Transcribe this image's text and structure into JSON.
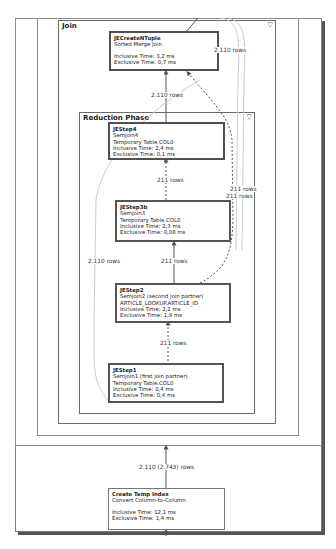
{
  "diagram": {
    "type": "query execution plan",
    "groups": {
      "join": {
        "title": "Join",
        "collapse_icon": "▽"
      },
      "reduction": {
        "title": "Reduction Phase",
        "collapse_icon": "▽"
      }
    },
    "nodes": {
      "create_ntuple": {
        "name": "JECreateNTuple",
        "op": "Sorted Merge Join",
        "inclusive": "Inclusive Time: 3,2 ms",
        "exclusive": "Exclusive Time: 0,7 ms"
      },
      "step4": {
        "name": "JEStep4",
        "op": "Semjoin4",
        "table": "Temporary Table.COL0",
        "inclusive": "Inclusive Time: 2,4 ms",
        "exclusive": "Exclusive Time: 0,1 ms"
      },
      "step3b": {
        "name": "JEStep3b",
        "op": "Semjoin3",
        "table": "Temporary Table.COL0",
        "inclusive": "Inclusive Time: 2,3 ms",
        "exclusive": "Exclusive Time: 0,08 ms"
      },
      "step2": {
        "name": "JEStep2",
        "op": "Semjoin2 (second join partner)",
        "table": "ARTICLE_LOOKUP.ARTICLE_ID",
        "inclusive": "Inclusive Time: 2,2 ms",
        "exclusive": "Exclusive Time: 1,9 ms"
      },
      "step1": {
        "name": "JEStep1",
        "op": "Semjoin1 (first join partner)",
        "table": "Temporary Table.COL0",
        "inclusive": "Inclusive Time: 0,4 ms",
        "exclusive": "Exclusive Time: 0,4 ms"
      },
      "temp_index": {
        "name": "Create Temp Index",
        "op": "Convert Column-to-Column",
        "inclusive": "Inclusive Time: 12,1 ms",
        "exclusive": "Exclusive Time: 1,4 ms"
      }
    },
    "edge_labels": {
      "top_right": "2.110 rows",
      "ntuple_in": "2.110 rows",
      "step4_in": "211 rows",
      "right_a": "211 rows",
      "right_b": "211 rows",
      "left_long": "2.110 rows",
      "step2_out": "211 rows",
      "step1_out": "211 rows",
      "temp_index_out": "2.110 (2.743) rows"
    }
  }
}
